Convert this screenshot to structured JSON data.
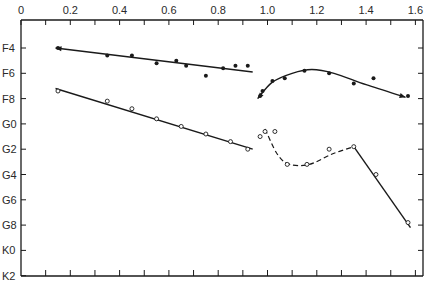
{
  "chart_data": {
    "type": "scatter",
    "title": "",
    "xlabel": "",
    "ylabel": "",
    "x_axis": {
      "position": "top",
      "range": [
        0,
        1.6
      ],
      "major_ticks": [
        0,
        0.2,
        0.4,
        0.6,
        0.8,
        1.0,
        1.2,
        1.4,
        1.6
      ],
      "tick_labels": [
        "0",
        "0.2",
        "0.4",
        "0.6",
        "0.8",
        "1.0",
        "1.2",
        "1.4",
        "1.6"
      ],
      "minor_step": 0.1
    },
    "y_axis": {
      "inverted": true,
      "categories": [
        "F4",
        "F6",
        "F8",
        "G0",
        "G2",
        "G4",
        "G6",
        "G8",
        "K0",
        "K2"
      ],
      "index_note": "index 0 = F4 ... index 9 = K2"
    },
    "grid": false,
    "legend": null,
    "series": [
      {
        "name": "filled-points-left",
        "marker": "filled",
        "line": "solid-fit",
        "points": [
          [
            0.15,
            0.0
          ],
          [
            0.35,
            0.3
          ],
          [
            0.45,
            0.3
          ],
          [
            0.55,
            0.6
          ],
          [
            0.63,
            0.5
          ],
          [
            0.67,
            0.7
          ],
          [
            0.75,
            1.1
          ],
          [
            0.82,
            0.8
          ],
          [
            0.87,
            0.7
          ],
          [
            0.92,
            0.7
          ]
        ],
        "fit": [
          [
            0.14,
            0.0
          ],
          [
            0.94,
            0.95
          ]
        ]
      },
      {
        "name": "open-points-left",
        "marker": "open",
        "line": "solid-fit",
        "points": [
          [
            0.15,
            1.7
          ],
          [
            0.35,
            2.1
          ],
          [
            0.45,
            2.4
          ],
          [
            0.55,
            2.8
          ],
          [
            0.65,
            3.1
          ],
          [
            0.75,
            3.4
          ],
          [
            0.85,
            3.7
          ],
          [
            0.92,
            4.0
          ]
        ],
        "fit": [
          [
            0.14,
            1.6
          ],
          [
            0.94,
            4.0
          ]
        ]
      },
      {
        "name": "filled-points-right",
        "marker": "filled",
        "line": "solid-curve",
        "points": [
          [
            0.97,
            1.9
          ],
          [
            0.98,
            1.7
          ],
          [
            1.02,
            1.3
          ],
          [
            1.07,
            1.2
          ],
          [
            1.15,
            0.9
          ],
          [
            1.25,
            1.0
          ],
          [
            1.35,
            1.4
          ],
          [
            1.43,
            1.2
          ],
          [
            1.57,
            1.9
          ]
        ],
        "curve": [
          [
            0.96,
            2.0
          ],
          [
            1.02,
            1.35
          ],
          [
            1.1,
            1.0
          ],
          [
            1.18,
            0.85
          ],
          [
            1.27,
            1.0
          ],
          [
            1.4,
            1.45
          ],
          [
            1.56,
            1.95
          ]
        ]
      },
      {
        "name": "open-points-right",
        "marker": "open",
        "line": "dashed-curve + solid-segment",
        "points": [
          [
            0.97,
            3.5
          ],
          [
            0.99,
            3.3
          ],
          [
            1.03,
            3.3
          ],
          [
            1.08,
            4.6
          ],
          [
            1.16,
            4.6
          ],
          [
            1.25,
            4.0
          ],
          [
            1.35,
            3.9
          ],
          [
            1.44,
            5.0
          ],
          [
            1.57,
            6.9
          ]
        ],
        "dashed_curve": [
          [
            0.99,
            3.2
          ],
          [
            1.04,
            4.2
          ],
          [
            1.09,
            4.6
          ],
          [
            1.17,
            4.6
          ],
          [
            1.26,
            4.2
          ],
          [
            1.35,
            3.9
          ]
        ],
        "solid_segment": [
          [
            1.35,
            3.9
          ],
          [
            1.58,
            7.1
          ]
        ]
      }
    ]
  }
}
